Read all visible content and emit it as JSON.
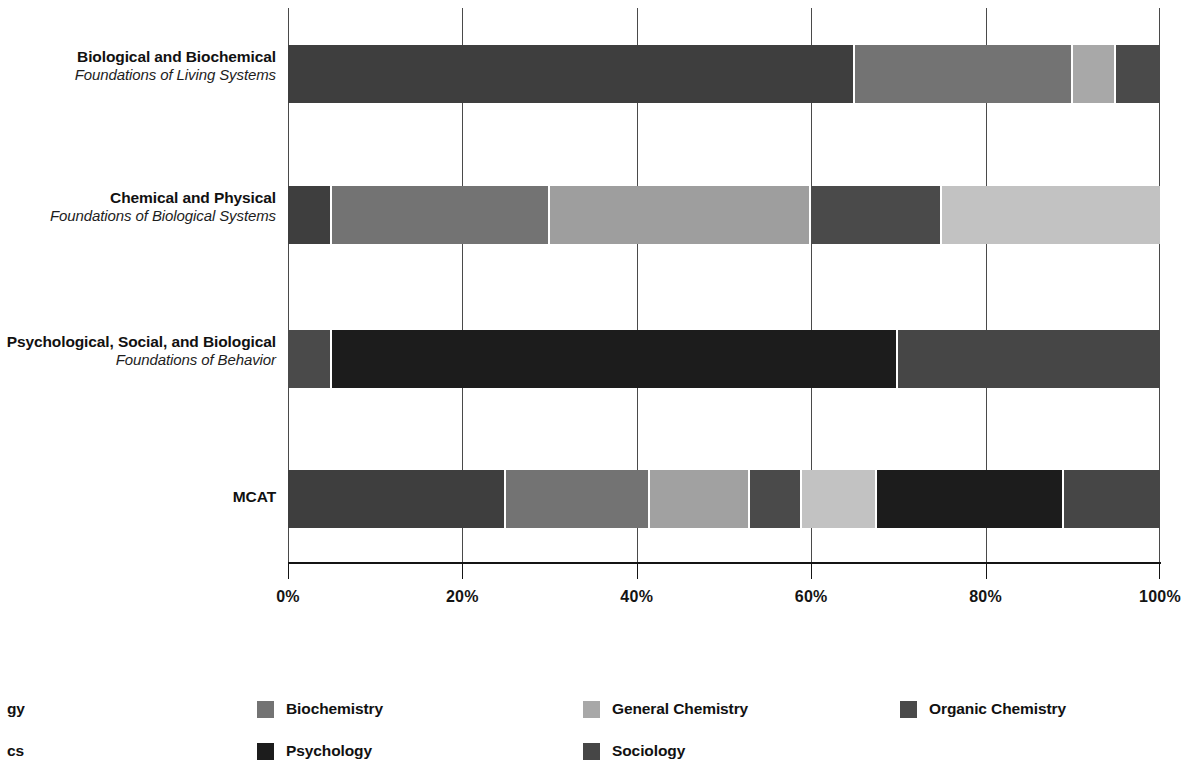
{
  "chart_data": {
    "type": "bar",
    "orientation": "horizontal",
    "stacked": true,
    "normalized": true,
    "title": "",
    "xlabel": "",
    "ylabel": "",
    "xlim": [
      0,
      100
    ],
    "xtick_labels": [
      "0%",
      "20%",
      "40%",
      "60%",
      "80%",
      "100%"
    ],
    "xticks": [
      0,
      20,
      40,
      60,
      80,
      100
    ],
    "grid": true,
    "grid_axis": "x",
    "legend_position": "bottom",
    "categories": [
      "Biological and Biochemical Foundations of Living Systems",
      "Chemical and Physical Foundations of Biological Systems",
      "Psychological, Social, and Biological Foundations of Behavior",
      "MCAT"
    ],
    "series": [
      {
        "name": "Biology",
        "color": "#3e3e3e",
        "values": [
          65,
          5,
          5,
          25
        ]
      },
      {
        "name": "Biochemistry",
        "color": "#737373",
        "values": [
          25,
          25,
          0,
          16.5
        ]
      },
      {
        "name": "General Chemistry",
        "color": "#a8a8a8",
        "values": [
          5,
          30,
          0,
          12
        ]
      },
      {
        "name": "Organic Chemistry",
        "color": "#4a4a4a",
        "values": [
          5,
          15,
          0,
          6
        ]
      },
      {
        "name": "Physics",
        "color": "#c2c2c2",
        "values": [
          0,
          25,
          0,
          8.5
        ]
      },
      {
        "name": "Psychology",
        "color": "#1c1c1c",
        "values": [
          0,
          0,
          65,
          21.5
        ]
      },
      {
        "name": "Sociology",
        "color": "#464646",
        "values": [
          0,
          0,
          30,
          10.5
        ]
      }
    ]
  },
  "axis": {
    "ticks": [
      {
        "label": "0%",
        "value": 0
      },
      {
        "label": "20%",
        "value": 20
      },
      {
        "label": "40%",
        "value": 40
      },
      {
        "label": "60%",
        "value": 60
      },
      {
        "label": "80%",
        "value": 80
      },
      {
        "label": "100%",
        "value": 100
      }
    ]
  },
  "rows": [
    {
      "main": "Biological and Biochemical",
      "sub": "Foundations of Living Systems",
      "segments": [
        {
          "series": "Biology",
          "value": 65,
          "color": "#3e3e3e"
        },
        {
          "series": "Biochemistry",
          "value": 25,
          "color": "#737373"
        },
        {
          "series": "General Chemistry",
          "value": 5,
          "color": "#a8a8a8"
        },
        {
          "series": "Organic Chemistry",
          "value": 5,
          "color": "#4a4a4a"
        }
      ]
    },
    {
      "main": "Chemical and Physical",
      "sub": "Foundations of Biological Systems",
      "segments": [
        {
          "series": "Biology",
          "value": 5,
          "color": "#3e3e3e"
        },
        {
          "series": "Biochemistry",
          "value": 25,
          "color": "#737373"
        },
        {
          "series": "General Chemistry",
          "value": 30,
          "color": "#9e9e9e"
        },
        {
          "series": "Organic Chemistry",
          "value": 15,
          "color": "#4a4a4a"
        },
        {
          "series": "Physics",
          "value": 25,
          "color": "#c2c2c2"
        }
      ]
    },
    {
      "main": "Psychological, Social, and Biological",
      "sub": "Foundations of Behavior",
      "segments": [
        {
          "series": "Biology",
          "value": 5,
          "color": "#4a4a4a"
        },
        {
          "series": "Psychology",
          "value": 65,
          "color": "#1c1c1c"
        },
        {
          "series": "Sociology",
          "value": 30,
          "color": "#464646"
        }
      ]
    },
    {
      "main": "MCAT",
      "sub": "",
      "segments": [
        {
          "series": "Biology",
          "value": 25,
          "color": "#3e3e3e"
        },
        {
          "series": "Biochemistry",
          "value": 16.5,
          "color": "#737373"
        },
        {
          "series": "General Chemistry",
          "value": 11.5,
          "color": "#a1a1a1"
        },
        {
          "series": "Organic Chemistry",
          "value": 6,
          "color": "#4a4a4a"
        },
        {
          "series": "Physics",
          "value": 8.5,
          "color": "#c2c2c2"
        },
        {
          "series": "Psychology",
          "value": 21.5,
          "color": "#1c1c1c"
        },
        {
          "series": "Sociology",
          "value": 11,
          "color": "#464646"
        }
      ]
    }
  ],
  "legend": {
    "items": [
      {
        "label": "Biology",
        "visible_label": "gy",
        "color": "#3e3e3e",
        "clipped": true,
        "column": 0,
        "row": 0
      },
      {
        "label": "Biochemistry",
        "visible_label": "Biochemistry",
        "color": "#737373",
        "clipped": false,
        "column": 1,
        "row": 0
      },
      {
        "label": "General Chemistry",
        "visible_label": "General Chemistry",
        "color": "#a8a8a8",
        "clipped": false,
        "column": 2,
        "row": 0
      },
      {
        "label": "Organic Chemistry",
        "visible_label": "Organic Chemistry",
        "color": "#4a4a4a",
        "clipped": false,
        "column": 3,
        "row": 0
      },
      {
        "label": "Physics",
        "visible_label": "cs",
        "color": "#c2c2c2",
        "clipped": true,
        "column": 0,
        "row": 1
      },
      {
        "label": "Psychology",
        "visible_label": "Psychology",
        "color": "#1c1c1c",
        "clipped": false,
        "column": 1,
        "row": 1
      },
      {
        "label": "Sociology",
        "visible_label": "Sociology",
        "color": "#464646",
        "clipped": false,
        "column": 2,
        "row": 1
      }
    ]
  }
}
